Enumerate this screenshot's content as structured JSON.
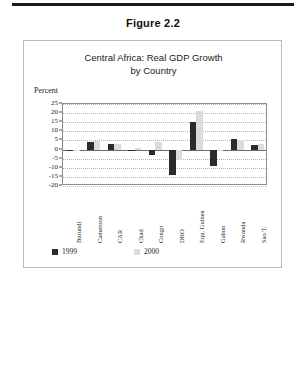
{
  "page": {
    "figure_caption": "Figure 2.2"
  },
  "chart_box": {
    "heading_line1": "Central Africa: Real GDP Growth",
    "heading_line2": "by Country",
    "axis_unit_label": "Percent"
  },
  "legend": {
    "items": [
      {
        "label": "1999",
        "color": "#2b2b2b"
      },
      {
        "label": "2000",
        "color": "#dcdcdc"
      }
    ]
  },
  "chart_data": {
    "type": "bar",
    "title": "Central Africa: Real GDP Growth by Country",
    "xlabel": "",
    "ylabel": "Percent",
    "ylim": [
      -20,
      25
    ],
    "ytick_step": 5,
    "yticks": [
      25,
      20,
      15,
      10,
      5,
      0,
      -5,
      -10,
      -15,
      -20
    ],
    "ytick_labels": [
      "25",
      "20",
      "15",
      "10",
      "5",
      "0",
      "-5",
      "-10",
      "-15",
      "-20"
    ],
    "grid": true,
    "legend_position": "bottom-left",
    "categories": [
      "Burundi",
      "Cameroon",
      "CAR",
      "Chad",
      "Congo",
      "DRO",
      "Equ. Guinea",
      "Gabon",
      "Rwanda",
      "Sao T."
    ],
    "series": [
      {
        "name": "1999",
        "color": "#2b2b2b",
        "values": [
          -1,
          4,
          3,
          -0.5,
          -3,
          -14,
          15,
          -9,
          6,
          2.5
        ]
      },
      {
        "name": "2000",
        "color": "#dcdcdc",
        "values": [
          -0.5,
          4.5,
          3,
          1,
          4,
          -6,
          21,
          -1,
          5.5,
          3
        ]
      }
    ]
  }
}
